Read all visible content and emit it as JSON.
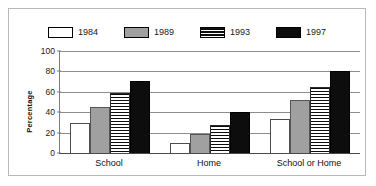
{
  "chart_data": {
    "type": "bar",
    "title": "",
    "xlabel": "",
    "ylabel": "Percentage",
    "ylim": [
      0,
      100
    ],
    "yticks": [
      0,
      20,
      40,
      60,
      80,
      100
    ],
    "grid": true,
    "legend_position": "top",
    "categories": [
      "School",
      "Home",
      "School or Home"
    ],
    "series": [
      {
        "name": "1984",
        "swatch": "white",
        "values": [
          29,
          10,
          33
        ]
      },
      {
        "name": "1989",
        "swatch": "gray",
        "values": [
          45,
          19,
          52
        ]
      },
      {
        "name": "1993",
        "swatch": "stripe",
        "values": [
          59,
          27,
          65
        ]
      },
      {
        "name": "1997",
        "swatch": "black",
        "values": [
          71,
          40,
          80
        ]
      }
    ]
  },
  "legend": {
    "items": [
      {
        "label": "1984"
      },
      {
        "label": "1989"
      },
      {
        "label": "1993"
      },
      {
        "label": "1997"
      }
    ]
  },
  "axis": {
    "y_title": "Percentage",
    "y_ticks": [
      "100",
      "80",
      "60",
      "40",
      "20",
      "0"
    ],
    "x_ticks": [
      "School",
      "Home",
      "School or Home"
    ]
  },
  "colors": {
    "series_1984": "#ffffff",
    "series_1989": "#a0a0a0",
    "series_1993": "#0d0d0d",
    "series_1997": "#0d0d0d",
    "grid": "#8d8d8d",
    "axis": "#4a4a4a",
    "border": "#b9b9b9",
    "text": "#111111"
  }
}
